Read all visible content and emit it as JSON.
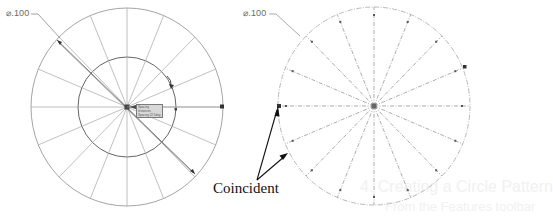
{
  "figure_left": {
    "label": "Sketch with circular pattern of lines (editing)",
    "dimension": "⌀.100",
    "outer_circle": {
      "cx": 127,
      "cy": 107,
      "rx": 96,
      "ry": 99
    },
    "inner_circle": {
      "cx": 127,
      "cy": 107,
      "rx": 49,
      "ry": 50
    },
    "spoke_count": 16,
    "spoke_style": "solid",
    "tooltip_rows": [
      "Spacing",
      "Instances",
      "Spacing 22.5deg"
    ]
  },
  "figure_right": {
    "label": "Sketch with construction spokes",
    "dimension": "⌀.100",
    "outer_circle": {
      "cx": 374,
      "cy": 106,
      "rx": 96,
      "ry": 99
    },
    "spoke_count": 16,
    "spoke_style": "dashed",
    "callout": "Coincident"
  },
  "background_bleed": {
    "line1": "4. Creating a Circle Pattern",
    "line2": "From the Features toolbar"
  },
  "colors": {
    "line": "#9a9a9a",
    "dark_line": "#555555",
    "text": "#111111",
    "dim_text": "#6a6a6a"
  }
}
